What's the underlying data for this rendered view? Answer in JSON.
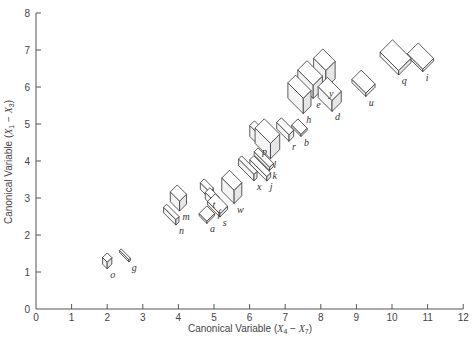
{
  "chart_data": {
    "type": "scatter",
    "title": "",
    "xlabel": "Canonical Variable (X4 − X7)",
    "ylabel": "Canonical Variable (X1 − X3)",
    "xlim": [
      0,
      12
    ],
    "ylim": [
      0,
      8
    ],
    "xticks": [
      "0",
      "1",
      "2",
      "3",
      "4",
      "5",
      "6",
      "7",
      "8",
      "9",
      "10",
      "11",
      "12"
    ],
    "yticks": [
      "0",
      "1",
      "2",
      "3",
      "4",
      "5",
      "6",
      "7",
      "8"
    ],
    "grid": false,
    "legend": null,
    "marker": "3-D box glyph (size encodes additional variables)",
    "points": [
      {
        "label": "o",
        "x": 2.0,
        "y": 1.3,
        "w": 0.3,
        "d": 0.3,
        "h": 0.3
      },
      {
        "label": "g",
        "x": 2.5,
        "y": 1.45,
        "w": 0.6,
        "d": 0.1,
        "h": 0.1
      },
      {
        "label": "n",
        "x": 3.8,
        "y": 2.55,
        "w": 0.8,
        "d": 0.2,
        "h": 0.25
      },
      {
        "label": "m",
        "x": 4.0,
        "y": 3.0,
        "w": 0.6,
        "d": 0.45,
        "h": 0.45
      },
      {
        "label": "a",
        "x": 4.8,
        "y": 2.55,
        "w": 0.5,
        "d": 0.5,
        "h": 0.1
      },
      {
        "label": "t",
        "x": 4.8,
        "y": 3.25,
        "w": 0.6,
        "d": 0.25,
        "h": 0.3
      },
      {
        "label": "f",
        "x": 4.95,
        "y": 3.0,
        "w": 0.6,
        "d": 0.3,
        "h": 0.3
      },
      {
        "label": "s",
        "x": 5.1,
        "y": 2.8,
        "w": 0.8,
        "d": 0.5,
        "h": 0.15
      },
      {
        "label": "w",
        "x": 5.5,
        "y": 3.3,
        "w": 0.8,
        "d": 0.5,
        "h": 0.6
      },
      {
        "label": "x",
        "x": 5.95,
        "y": 3.8,
        "w": 1.0,
        "d": 0.2,
        "h": 0.3
      },
      {
        "label": "j",
        "x": 6.3,
        "y": 3.8,
        "w": 1.1,
        "d": 0.25,
        "h": 0.2
      },
      {
        "label": "k",
        "x": 6.4,
        "y": 4.05,
        "w": 1.0,
        "d": 0.25,
        "h": 0.15
      },
      {
        "label": "l",
        "x": 6.5,
        "y": 4.6,
        "w": 1.0,
        "d": 0.6,
        "h": 0.7
      },
      {
        "label": "p",
        "x": 6.2,
        "y": 4.75,
        "w": 0.6,
        "d": 0.3,
        "h": 0.5
      },
      {
        "label": "r",
        "x": 7.0,
        "y": 4.85,
        "w": 0.8,
        "d": 0.3,
        "h": 0.3
      },
      {
        "label": "b",
        "x": 7.4,
        "y": 4.9,
        "w": 0.6,
        "d": 0.4,
        "h": 0.1
      },
      {
        "label": "h",
        "x": 7.4,
        "y": 5.8,
        "w": 1.0,
        "d": 0.5,
        "h": 0.7
      },
      {
        "label": "e",
        "x": 7.7,
        "y": 6.2,
        "w": 1.0,
        "d": 0.6,
        "h": 0.6
      },
      {
        "label": "d",
        "x": 8.25,
        "y": 5.8,
        "w": 0.9,
        "d": 0.6,
        "h": 0.5
      },
      {
        "label": "y",
        "x": 8.1,
        "y": 6.5,
        "w": 0.8,
        "d": 0.6,
        "h": 0.8
      },
      {
        "label": "u",
        "x": 9.2,
        "y": 6.1,
        "w": 0.9,
        "d": 0.6,
        "h": 0.15
      },
      {
        "label": "q",
        "x": 10.1,
        "y": 6.8,
        "w": 1.2,
        "d": 0.8,
        "h": 0.2
      },
      {
        "label": "i",
        "x": 10.8,
        "y": 6.8,
        "w": 1.0,
        "d": 0.7,
        "h": 0.12
      }
    ]
  },
  "axes": {
    "x_title_main": "Canonical Variable (",
    "x_title_var1": "X",
    "x_title_sub1": "4",
    "x_title_mid": " − ",
    "x_title_var2": "X",
    "x_title_sub2": "7",
    "x_title_end": ")",
    "y_title_main": "Canonical Variable (",
    "y_title_var1": "X",
    "y_title_sub1": "1",
    "y_title_mid": " − ",
    "y_title_var2": "X",
    "y_title_sub2": "3",
    "y_title_end": ")"
  },
  "colors": {
    "top": "#ffffff",
    "front": "#f4f4f4",
    "side": "#e6e6e6",
    "stroke": "#333333",
    "axis": "#555555"
  }
}
